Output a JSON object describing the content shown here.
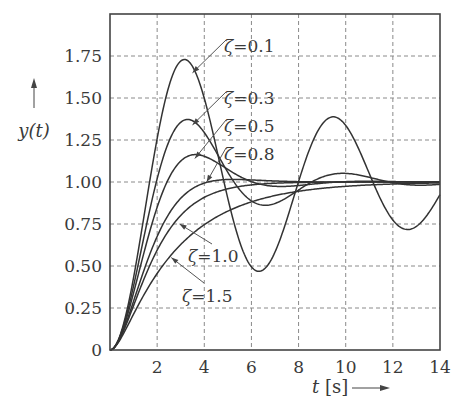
{
  "chart_data": {
    "type": "line",
    "title": "",
    "xlabel": "t [s]",
    "ylabel": "y(t)",
    "xlim": [
      0,
      14
    ],
    "ylim": [
      0,
      2.0
    ],
    "grid": true,
    "x_ticks": [
      2,
      4,
      6,
      8,
      10,
      12,
      14
    ],
    "x_tick_labels": [
      "2",
      "4",
      "6",
      "8",
      "10",
      "12",
      "14"
    ],
    "y_ticks": [
      0,
      0.25,
      0.5,
      0.75,
      1.0,
      1.25,
      1.5,
      1.75
    ],
    "y_tick_labels": [
      "0",
      "0.25",
      "0.50",
      "0.75",
      "1.00",
      "1.25",
      "1.50",
      "1.75"
    ],
    "model": "second-order unit step response, natural frequency 1 rad/s",
    "series": [
      {
        "name": "ζ=0.1",
        "zeta": 0.1,
        "label": "ζ = 0.1",
        "peak": {
          "t": 3.16,
          "y": 1.73
        }
      },
      {
        "name": "ζ=0.3",
        "zeta": 0.3,
        "label": "ζ = 0.3",
        "peak": {
          "t": 3.29,
          "y": 1.37
        }
      },
      {
        "name": "ζ=0.5",
        "zeta": 0.5,
        "label": "ζ = 0.5",
        "peak": {
          "t": 3.63,
          "y": 1.16
        }
      },
      {
        "name": "ζ=0.8",
        "zeta": 0.8,
        "label": "ζ = 0.8",
        "peak": {
          "t": 5.24,
          "y": 1.015
        }
      },
      {
        "name": "ζ=1.0",
        "zeta": 1.0,
        "label": "ζ = 1.0"
      },
      {
        "name": "ζ=1.5",
        "zeta": 1.5,
        "label": "ζ = 1.5"
      }
    ],
    "annotations": [
      {
        "text": "ζ = 0.1",
        "points_to": {
          "t": 3.5,
          "y": 1.65
        }
      },
      {
        "text": "ζ = 0.3",
        "points_to": {
          "t": 3.5,
          "y": 1.34
        }
      },
      {
        "text": "ζ = 0.5",
        "points_to": {
          "t": 3.6,
          "y": 1.14
        }
      },
      {
        "text": "ζ = 0.8",
        "points_to": {
          "t": 4.1,
          "y": 1.0
        }
      },
      {
        "text": "ζ = 1.0",
        "points_to": {
          "t": 2.95,
          "y": 0.75
        }
      },
      {
        "text": "ζ = 1.5",
        "points_to": {
          "t": 2.6,
          "y": 0.55
        }
      }
    ],
    "axis_labels": {
      "y": "y(t)",
      "x_var": "t",
      "x_unit": "[s]"
    }
  }
}
